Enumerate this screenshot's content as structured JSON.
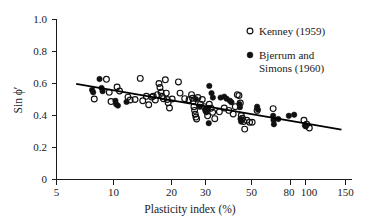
{
  "chart_data": {
    "type": "scatter",
    "title": "",
    "xlabel": "Plasticity index (%)",
    "ylabel": "Sin ϕ′",
    "xscale": "log",
    "yscale": "linear",
    "xlim": [
      5,
      150
    ],
    "ylim": [
      0,
      1.0
    ],
    "grid": false,
    "legend_position": "top-right",
    "xticks": [
      5,
      10,
      20,
      30,
      50,
      80,
      100,
      150
    ],
    "xtick_labels": [
      "5",
      "10",
      "20",
      "30",
      "50",
      "80",
      "100",
      "150"
    ],
    "yticks": [
      0,
      0.2,
      0.4,
      0.6,
      0.8,
      1.0
    ],
    "ytick_labels": [
      "0",
      "0.2",
      "0.4",
      "0.6",
      "0.8",
      "1.0"
    ],
    "series": [
      {
        "name": "Kenney (1959)",
        "marker": "open-circle",
        "color": "#111111",
        "points": [
          [
            7.8,
            0.503
          ],
          [
            9.0,
            0.626
          ],
          [
            9.3,
            0.545
          ],
          [
            9.5,
            0.487
          ],
          [
            10.2,
            0.578
          ],
          [
            10.5,
            0.553
          ],
          [
            11.6,
            0.515
          ],
          [
            11.9,
            0.497
          ],
          [
            12.6,
            0.5
          ],
          [
            13.4,
            0.632
          ],
          [
            13.8,
            0.492
          ],
          [
            14.4,
            0.52
          ],
          [
            14.8,
            0.467
          ],
          [
            15.3,
            0.515
          ],
          [
            15.6,
            0.52
          ],
          [
            16.0,
            0.497
          ],
          [
            16.4,
            0.53
          ],
          [
            16.7,
            0.6
          ],
          [
            16.9,
            0.575
          ],
          [
            17.1,
            0.545
          ],
          [
            17.3,
            0.52
          ],
          [
            17.6,
            0.505
          ],
          [
            18.0,
            0.623
          ],
          [
            18.2,
            0.54
          ],
          [
            18.4,
            0.5
          ],
          [
            18.6,
            0.48
          ],
          [
            18.9,
            0.447
          ],
          [
            19.5,
            0.503
          ],
          [
            21.0,
            0.61
          ],
          [
            21.4,
            0.54
          ],
          [
            22.6,
            0.505
          ],
          [
            23.8,
            0.498
          ],
          [
            24.5,
            0.53
          ],
          [
            24.8,
            0.508
          ],
          [
            25.0,
            0.49
          ],
          [
            25.2,
            0.455
          ],
          [
            25.4,
            0.432
          ],
          [
            25.6,
            0.408
          ],
          [
            25.8,
            0.39
          ],
          [
            26.0,
            0.378
          ],
          [
            26.4,
            0.512
          ],
          [
            27.2,
            0.47
          ],
          [
            27.8,
            0.5
          ],
          [
            28.4,
            0.455
          ],
          [
            29.0,
            0.432
          ],
          [
            29.6,
            0.398
          ],
          [
            30.2,
            0.47
          ],
          [
            30.8,
            0.445
          ],
          [
            31.4,
            0.42
          ],
          [
            32.2,
            0.38
          ],
          [
            34.0,
            0.423
          ],
          [
            36.0,
            0.447
          ],
          [
            38.0,
            0.432
          ],
          [
            40.0,
            0.41
          ],
          [
            41.0,
            0.455
          ],
          [
            42.0,
            0.53
          ],
          [
            42.8,
            0.525
          ],
          [
            43.5,
            0.478
          ],
          [
            44.0,
            0.4
          ],
          [
            44.6,
            0.383
          ],
          [
            45.2,
            0.362
          ],
          [
            45.8,
            0.315
          ],
          [
            47.0,
            0.37
          ],
          [
            48.5,
            0.358
          ],
          [
            50.0,
            0.358
          ],
          [
            53.0,
            0.432
          ],
          [
            64.0,
            0.443
          ],
          [
            92.0,
            0.37
          ],
          [
            95.0,
            0.345
          ],
          [
            98.0,
            0.322
          ]
        ]
      },
      {
        "name": "Bjerrum and Simons (1960)",
        "marker": "filled-circle",
        "color": "#111111",
        "points": [
          [
            7.6,
            0.56
          ],
          [
            7.7,
            0.545
          ],
          [
            8.3,
            0.628
          ],
          [
            8.5,
            0.572
          ],
          [
            8.6,
            0.552
          ],
          [
            10.0,
            0.492
          ],
          [
            10.1,
            0.47
          ],
          [
            10.3,
            0.462
          ],
          [
            11.4,
            0.485
          ],
          [
            25.8,
            0.502
          ],
          [
            27.0,
            0.455
          ],
          [
            28.8,
            0.44
          ],
          [
            29.2,
            0.42
          ],
          [
            29.8,
            0.447
          ],
          [
            30.0,
            0.352
          ],
          [
            30.2,
            0.585
          ],
          [
            31.0,
            0.54
          ],
          [
            31.5,
            0.512
          ],
          [
            34.5,
            0.512
          ],
          [
            36.0,
            0.518
          ],
          [
            37.0,
            0.505
          ],
          [
            38.5,
            0.492
          ],
          [
            39.2,
            0.483
          ],
          [
            43.0,
            0.472
          ],
          [
            43.3,
            0.452
          ],
          [
            43.6,
            0.38
          ],
          [
            43.9,
            0.362
          ],
          [
            53.0,
            0.455
          ],
          [
            53.5,
            0.437
          ],
          [
            64.0,
            0.398
          ],
          [
            64.3,
            0.372
          ],
          [
            64.6,
            0.345
          ],
          [
            68.0,
            0.378
          ],
          [
            77.0,
            0.398
          ],
          [
            82.0,
            0.405
          ],
          [
            93.0,
            0.338
          ],
          [
            94.0,
            0.332
          ]
        ]
      }
    ],
    "trend_line": {
      "name": "best-fit-line",
      "x_start": 6.3,
      "y_start": 0.598,
      "x_end": 143.0,
      "y_end": 0.312
    }
  },
  "legend": {
    "entries": [
      {
        "marker": "open-circle",
        "label": "Kenney (1959)"
      },
      {
        "marker": "filled-circle",
        "label_line1": "Bjerrum and",
        "label_line2": "Simons (1960)"
      }
    ]
  }
}
